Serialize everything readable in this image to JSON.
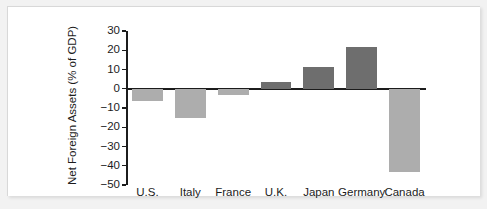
{
  "chart_data": {
    "type": "bar",
    "title": "",
    "subtitle": "",
    "xlabel": "",
    "ylabel": "Net Foreign Assets (% of GDP)",
    "categories": [
      "U.S.",
      "Italy",
      "France",
      "U.K.",
      "Japan",
      "Germany",
      "Canada"
    ],
    "values": [
      -6.5,
      -15,
      -3.5,
      3.5,
      11.5,
      21.5,
      -43
    ],
    "ylim": [
      -50,
      30
    ],
    "ytick_labels": [
      "30",
      "20",
      "10",
      "0",
      "−10",
      "−20",
      "−30",
      "−40",
      "−50"
    ],
    "ytick_values": [
      30,
      20,
      10,
      0,
      -10,
      -20,
      -30,
      -40,
      -50
    ],
    "grid": false,
    "legend": "none",
    "bar_colors": {
      "positive": "#6e6e6e",
      "negative": "#adadad"
    },
    "axis_color": "#1c1c1c",
    "background": "#ffffff"
  }
}
